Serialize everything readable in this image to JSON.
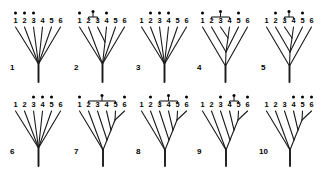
{
  "figure": {
    "tip_labels": [
      "1",
      "2",
      "3",
      "4",
      "5",
      "6"
    ],
    "taxon_count": 6,
    "panel_count": 10,
    "line_color": "#1a1a1a",
    "dot_color": "#000000",
    "background_color": "#ffffff",
    "marker_names": {
      "dot": "dot-marker",
      "bracket": "clade-bracket"
    }
  },
  "panels": [
    {
      "label": "1",
      "topology": "star",
      "nodes": [
        {
          "x": 32.5,
          "y": 62.0,
          "children_tips": [
            1,
            2,
            3,
            4,
            5,
            6
          ]
        }
      ],
      "dots": [
        {
          "tip": 1
        },
        {
          "tip": 2
        },
        {
          "tip": 3
        }
      ],
      "brackets": []
    },
    {
      "label": "2",
      "topology": "one-cherry",
      "nodes": [
        {
          "x": 35.0,
          "y": 40.0,
          "children_tips": [
            3,
            4
          ]
        },
        {
          "x": 32.5,
          "y": 62.0,
          "children_tips": [
            1,
            2,
            5,
            6
          ]
        }
      ],
      "dots": [
        {
          "tip": 1
        },
        {
          "tip": 4
        }
      ],
      "brackets": [
        {
          "from_tip": 2,
          "to_tip": 3
        }
      ]
    },
    {
      "label": "3",
      "topology": "star",
      "nodes": [
        {
          "x": 32.5,
          "y": 62.0,
          "children_tips": [
            1,
            2,
            3,
            4,
            5,
            6
          ]
        }
      ],
      "dots": [
        {
          "tip": 2
        },
        {
          "tip": 3
        },
        {
          "tip": 4
        }
      ],
      "brackets": []
    },
    {
      "label": "4",
      "topology": "nested-triple",
      "nodes": [
        {
          "x": 35.0,
          "y": 36.0,
          "children_tips": [
            3,
            4
          ]
        },
        {
          "x": 33.0,
          "y": 50.0,
          "children_tips": [
            2,
            5
          ]
        },
        {
          "x": 32.5,
          "y": 64.0,
          "children_tips": [
            1,
            6
          ]
        }
      ],
      "dots": [
        {
          "tip": 1
        },
        {
          "tip": 5
        }
      ],
      "brackets": [
        {
          "from_tip": 2,
          "to_tip": 4
        }
      ]
    },
    {
      "label": "5",
      "topology": "nested-triple",
      "nodes": [
        {
          "x": 35.0,
          "y": 36.0,
          "children_tips": [
            3,
            4
          ]
        },
        {
          "x": 33.0,
          "y": 50.0,
          "children_tips": [
            2,
            5
          ]
        },
        {
          "x": 32.5,
          "y": 64.0,
          "children_tips": [
            1,
            6
          ]
        }
      ],
      "dots": [
        {
          "tip": 2
        },
        {
          "tip": 5
        }
      ],
      "brackets": [
        {
          "from_tip": 3,
          "to_tip": 4
        }
      ]
    },
    {
      "label": "6",
      "topology": "star",
      "nodes": [
        {
          "x": 32.5,
          "y": 62.0,
          "children_tips": [
            1,
            2,
            3,
            4,
            5,
            6
          ]
        }
      ],
      "dots": [
        {
          "tip": 3
        },
        {
          "tip": 4
        },
        {
          "tip": 5
        }
      ],
      "brackets": []
    },
    {
      "label": "7",
      "topology": "pectinate-ladder",
      "nodes": [
        {
          "x": 45.0,
          "y": 34.0,
          "children_tips": [
            5,
            6
          ]
        },
        {
          "x": 41.0,
          "y": 44.0,
          "children_tips": [
            4
          ]
        },
        {
          "x": 37.0,
          "y": 54.0,
          "children_tips": [
            3
          ]
        },
        {
          "x": 33.0,
          "y": 64.0,
          "children_tips": [
            2
          ]
        },
        {
          "x": 32.5,
          "y": 64.0,
          "children_tips": [
            1
          ]
        }
      ],
      "dots": [
        {
          "tip": 1
        },
        {
          "tip": 6
        }
      ],
      "brackets": [
        {
          "from_tip": 2,
          "to_tip": 5
        }
      ]
    },
    {
      "label": "8",
      "topology": "pectinate-ladder",
      "nodes": [
        {
          "x": 45.0,
          "y": 34.0,
          "children_tips": [
            5,
            6
          ]
        },
        {
          "x": 41.0,
          "y": 44.0,
          "children_tips": [
            4
          ]
        },
        {
          "x": 37.0,
          "y": 54.0,
          "children_tips": [
            3
          ]
        },
        {
          "x": 33.0,
          "y": 64.0,
          "children_tips": [
            2
          ]
        },
        {
          "x": 32.5,
          "y": 64.0,
          "children_tips": [
            1
          ]
        }
      ],
      "dots": [
        {
          "tip": 2
        },
        {
          "tip": 6
        }
      ],
      "brackets": [
        {
          "from_tip": 3,
          "to_tip": 5
        }
      ]
    },
    {
      "label": "9",
      "topology": "pectinate-ladder",
      "nodes": [
        {
          "x": 45.0,
          "y": 34.0,
          "children_tips": [
            5,
            6
          ]
        },
        {
          "x": 41.0,
          "y": 44.0,
          "children_tips": [
            4
          ]
        },
        {
          "x": 37.0,
          "y": 54.0,
          "children_tips": [
            3
          ]
        },
        {
          "x": 33.0,
          "y": 64.0,
          "children_tips": [
            2
          ]
        },
        {
          "x": 32.5,
          "y": 64.0,
          "children_tips": [
            1
          ]
        }
      ],
      "dots": [
        {
          "tip": 3
        },
        {
          "tip": 6
        }
      ],
      "brackets": [
        {
          "from_tip": 4,
          "to_tip": 5
        }
      ]
    },
    {
      "label": "10",
      "topology": "pectinate-ladder",
      "nodes": [
        {
          "x": 45.0,
          "y": 34.0,
          "children_tips": [
            5,
            6
          ]
        },
        {
          "x": 41.0,
          "y": 44.0,
          "children_tips": [
            4
          ]
        },
        {
          "x": 37.0,
          "y": 54.0,
          "children_tips": [
            3
          ]
        },
        {
          "x": 33.0,
          "y": 64.0,
          "children_tips": [
            2
          ]
        },
        {
          "x": 32.5,
          "y": 64.0,
          "children_tips": [
            1
          ]
        }
      ],
      "dots": [
        {
          "tip": 4
        },
        {
          "tip": 5
        },
        {
          "tip": 6
        }
      ],
      "brackets": []
    }
  ],
  "geometry": {
    "panel_origins": [
      {
        "x": 6,
        "y": 2
      },
      {
        "x": 70,
        "y": 2
      },
      {
        "x": 132,
        "y": 2
      },
      {
        "x": 193,
        "y": 2
      },
      {
        "x": 257,
        "y": 2
      },
      {
        "x": 6,
        "y": 86
      },
      {
        "x": 70,
        "y": 86
      },
      {
        "x": 132,
        "y": 86
      },
      {
        "x": 193,
        "y": 86
      },
      {
        "x": 257,
        "y": 86
      }
    ],
    "label_offsets": [
      {
        "x": 4,
        "y": 62
      },
      {
        "x": 4,
        "y": 62
      },
      {
        "x": 4,
        "y": 62
      },
      {
        "x": 4,
        "y": 62
      },
      {
        "x": 4,
        "y": 62
      },
      {
        "x": 4,
        "y": 62
      },
      {
        "x": 4,
        "y": 62
      },
      {
        "x": 4,
        "y": 62
      },
      {
        "x": 4,
        "y": 62
      },
      {
        "x": 2,
        "y": 62
      }
    ],
    "tip_x": [
      9.5,
      18.5,
      27.5,
      36.5,
      45.5,
      54.5
    ],
    "tip_label_y": 21,
    "tip_top_y": 25,
    "dot_y": 11,
    "dot_radius": 1.5,
    "bracket_y": 15,
    "bracket_stem_top": 9.5,
    "root_y": 80
  }
}
